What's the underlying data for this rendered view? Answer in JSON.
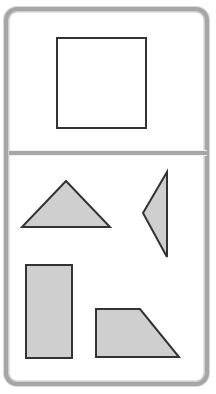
{
  "canvas": {
    "width": 216,
    "height": 394,
    "background": "#ffffff"
  },
  "frame": {
    "name": "rounded-device-frame",
    "border_color": "#a6a6a6",
    "highlight_color": "#efefef",
    "fill": "#ffffff",
    "corner_radius": 13
  },
  "divider": {
    "name": "horizontal-panel-divider",
    "color": "#a6a6a6",
    "y": 150,
    "thickness": 6
  },
  "style": {
    "shape_fill": "#cfcfcf",
    "shape_stroke": "#333333",
    "shape_stroke_width": 2,
    "empty_shape_fill": "#ffffff"
  },
  "panels": [
    {
      "id": "top",
      "name": "top-panel",
      "x": 9,
      "y": 12,
      "width": 198,
      "height": 138,
      "shape_count": 1
    },
    {
      "id": "bottom",
      "name": "bottom-panel",
      "x": 9,
      "y": 156,
      "width": 198,
      "height": 225,
      "shape_count": 4
    }
  ],
  "shapes": {
    "square_outline": {
      "label": "square",
      "panel": "top",
      "fill": "#ffffff",
      "stroke": "#333333",
      "points": "48,26 137,26 137,116 48,116",
      "bbox": [
        57,
        38,
        89,
        90
      ]
    },
    "triangle_isosceles": {
      "label": "triangle",
      "panel": "bottom",
      "fill": "#cfcfcf",
      "stroke": "#333333",
      "points": "57,25 101,71 13,71",
      "bbox": [
        22,
        181,
        88,
        46
      ]
    },
    "triangle_narrow_left": {
      "label": "narrow-triangle-pointing-left",
      "panel": "bottom",
      "fill": "#cfcfcf",
      "stroke": "#333333",
      "points": "158,16 158,101 134,57",
      "bbox": [
        143,
        172,
        24,
        85
      ]
    },
    "rectangle_vertical": {
      "label": "rectangle",
      "panel": "bottom",
      "fill": "#cfcfcf",
      "stroke": "#333333",
      "points": "17,109 63,109 63,202 17,202",
      "bbox": [
        26,
        265,
        46,
        93
      ]
    },
    "trapezoid_right": {
      "label": "right-trapezoid",
      "panel": "bottom",
      "fill": "#cfcfcf",
      "stroke": "#333333",
      "points": "87,153 131,153 170,201 87,201",
      "bbox": [
        96,
        309,
        83,
        48
      ]
    }
  }
}
